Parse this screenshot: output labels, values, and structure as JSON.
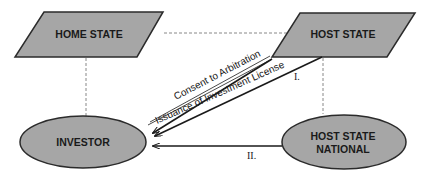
{
  "diagram": {
    "colors": {
      "shape_fill": "#a6a6a6",
      "shape_stroke": "#2b2b2b",
      "line": "#1a1a1a",
      "dashed": "#888888",
      "background": "#ffffff"
    },
    "nodes": {
      "home_state": {
        "label": "HOME STATE",
        "shape": "parallelogram"
      },
      "host_state": {
        "label": "HOST STATE",
        "shape": "parallelogram"
      },
      "investor": {
        "label": "INVESTOR",
        "shape": "ellipse"
      },
      "host_state_national": {
        "label_line1": "HOST STATE",
        "label_line2": "NATIONAL",
        "shape": "ellipse"
      }
    },
    "edges": {
      "consent": {
        "label": "Consent to Arbitration",
        "from": "INVESTOR",
        "to": "HOST STATE"
      },
      "license": {
        "label": "Issuance of Investment License",
        "from": "HOST STATE",
        "to": "INVESTOR"
      },
      "relation_one": {
        "label": "I.",
        "from": "HOST STATE",
        "to": "INVESTOR"
      },
      "relation_two": {
        "label": "II.",
        "from": "HOST STATE NATIONAL",
        "to": "INVESTOR"
      },
      "dashed_links": [
        "HOME STATE — HOST STATE",
        "HOME STATE — INVESTOR",
        "HOST STATE — HOST STATE NATIONAL"
      ]
    }
  }
}
